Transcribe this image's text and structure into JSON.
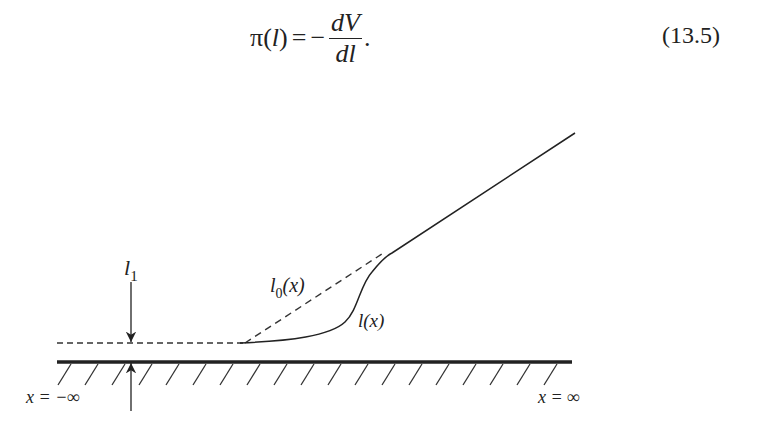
{
  "equation": {
    "lhs_func": "π",
    "lhs_arg": "l",
    "equals": "=",
    "minus": "−",
    "numerator": "dV",
    "denominator": "dl",
    "trailing": ".",
    "number": "(13.5)"
  },
  "figure": {
    "labels": {
      "l1_main": "l",
      "l1_sub": "1",
      "l0_main": "l",
      "l0_sub": "0",
      "l0_arg": "(x)",
      "lx": "l(x)",
      "x_minus_inf": "x = −∞",
      "x_plus_inf": "x = ∞"
    },
    "curves": [
      {
        "name": "l1-baseline",
        "style": "dashed",
        "description": "equilibrium film thickness l1 at x = −∞"
      },
      {
        "name": "l0-profile",
        "style": "dashed",
        "description": "macroscopic profile l0(x)"
      },
      {
        "name": "l-profile",
        "style": "solid",
        "description": "actual profile l(x)"
      }
    ],
    "substrate": {
      "style": "thick solid line with hatch marks"
    },
    "arrows": [
      {
        "name": "thickness-arrow-down",
        "direction": "down"
      },
      {
        "name": "thickness-arrow-up",
        "direction": "up"
      }
    ],
    "colors": {
      "stroke": "#222222",
      "background": "#ffffff"
    }
  }
}
